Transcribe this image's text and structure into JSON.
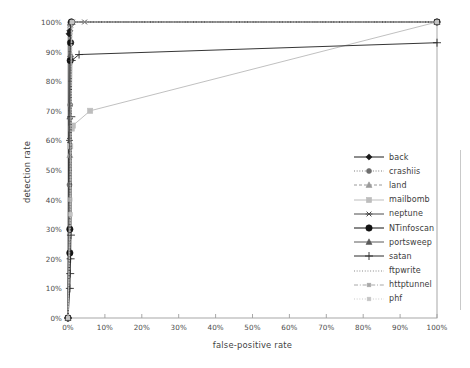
{
  "chart_data": {
    "type": "line",
    "title": "",
    "xlabel": "false-positive rate",
    "ylabel": "detection rate",
    "xlim": [
      0,
      100
    ],
    "ylim": [
      0,
      100
    ],
    "xticks": [
      "0%",
      "10%",
      "20%",
      "30%",
      "40%",
      "50%",
      "60%",
      "70%",
      "80%",
      "90%",
      "100%"
    ],
    "yticks": [
      "0%",
      "10%",
      "20%",
      "30%",
      "40%",
      "50%",
      "60%",
      "70%",
      "80%",
      "90%",
      "100%"
    ],
    "grid": false,
    "legend_position": "right",
    "series": [
      {
        "name": "back",
        "color": "#1a1a1a",
        "marker": "diamond",
        "linestyle": "solid",
        "points": [
          [
            0,
            0
          ],
          [
            0.3,
            96
          ],
          [
            0.5,
            97
          ],
          [
            1.0,
            100
          ],
          [
            100,
            100
          ]
        ]
      },
      {
        "name": "crashiis",
        "color": "#6e6e6e",
        "marker": "circle",
        "linestyle": "dotted",
        "points": [
          [
            0,
            0
          ],
          [
            0.4,
            45
          ],
          [
            0.6,
            72
          ],
          [
            0.9,
            100
          ],
          [
            100,
            100
          ]
        ]
      },
      {
        "name": "land",
        "color": "#9a9a9a",
        "marker": "triangle",
        "linestyle": "dashed",
        "points": [
          [
            0,
            0
          ],
          [
            0.5,
            55
          ],
          [
            0.8,
            88
          ],
          [
            1.1,
            100
          ],
          [
            100,
            100
          ]
        ]
      },
      {
        "name": "mailbomb",
        "color": "#bdbdbd",
        "marker": "square",
        "linestyle": "solid",
        "points": [
          [
            0,
            0
          ],
          [
            0.6,
            58
          ],
          [
            1.0,
            64
          ],
          [
            1.3,
            65
          ],
          [
            6.0,
            70
          ],
          [
            100,
            100
          ]
        ]
      },
      {
        "name": "neptune",
        "color": "#4a4a4a",
        "marker": "star",
        "linestyle": "solid",
        "points": [
          [
            0,
            0
          ],
          [
            0.4,
            60
          ],
          [
            0.7,
            99
          ],
          [
            1.2,
            100
          ],
          [
            4.5,
            100
          ],
          [
            100,
            100
          ]
        ]
      },
      {
        "name": "NTinfoscan",
        "color": "#111111",
        "marker": "bigcircle",
        "linestyle": "solid",
        "points": [
          [
            0,
            0
          ],
          [
            0.5,
            22
          ],
          [
            0.5,
            30
          ],
          [
            0.6,
            87
          ],
          [
            0.7,
            93
          ],
          [
            0.9,
            100
          ],
          [
            100,
            100
          ]
        ]
      },
      {
        "name": "portsweep",
        "color": "#5a5a5a",
        "marker": "triangle",
        "linestyle": "solid",
        "points": [
          [
            0,
            0
          ],
          [
            0.5,
            68
          ],
          [
            0.7,
            89
          ],
          [
            1.0,
            100
          ],
          [
            100,
            100
          ]
        ]
      },
      {
        "name": "satan",
        "color": "#2b2b2b",
        "marker": "plus",
        "linestyle": "solid",
        "points": [
          [
            0,
            0
          ],
          [
            0.5,
            10
          ],
          [
            0.6,
            15
          ],
          [
            0.7,
            20
          ],
          [
            0.8,
            28
          ],
          [
            0.9,
            68
          ],
          [
            1.0,
            87
          ],
          [
            3.0,
            89
          ],
          [
            100,
            93
          ]
        ]
      },
      {
        "name": "ftpwrite",
        "color": "#7d7d7d",
        "marker": "none",
        "linestyle": "dotted",
        "points": [
          [
            0,
            0
          ],
          [
            0.5,
            50
          ],
          [
            0.9,
            100
          ],
          [
            100,
            100
          ]
        ]
      },
      {
        "name": "httptunnel",
        "color": "#a8a8a8",
        "marker": "smallsquare",
        "linestyle": "dashdot",
        "points": [
          [
            0,
            0
          ],
          [
            0.6,
            40
          ],
          [
            1.0,
            100
          ],
          [
            100,
            100
          ]
        ]
      },
      {
        "name": "phf",
        "color": "#c4c4c4",
        "marker": "smallsquare",
        "linestyle": "dotted",
        "points": [
          [
            0,
            0
          ],
          [
            0.7,
            35
          ],
          [
            1.1,
            100
          ],
          [
            100,
            100
          ]
        ]
      }
    ]
  },
  "legend": {
    "items": [
      {
        "label": "back"
      },
      {
        "label": "crashiis"
      },
      {
        "label": "land"
      },
      {
        "label": "mailbomb"
      },
      {
        "label": "neptune"
      },
      {
        "label": "NTinfoscan"
      },
      {
        "label": "portsweep"
      },
      {
        "label": "satan"
      },
      {
        "label": "ftpwrite"
      },
      {
        "label": "httptunnel"
      },
      {
        "label": "phf"
      }
    ]
  },
  "axes": {
    "x_title": "false-positive rate",
    "y_title": "detection rate",
    "frame_color": "#9e9e9e"
  }
}
